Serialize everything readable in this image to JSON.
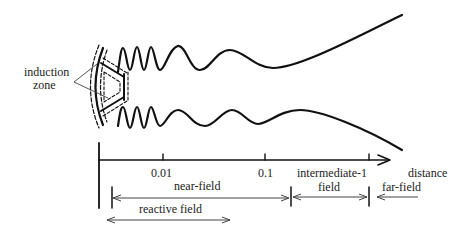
{
  "diagram": {
    "type": "antenna field regions",
    "labels": {
      "induction_zone_line1": "induction",
      "induction_zone_line2": "zone",
      "tick_1": "0.01",
      "tick_2": "0.1",
      "intermediate_line1": "intermediate-1",
      "intermediate_line2": "field",
      "axis_label": "distance",
      "near_field": "near-field",
      "far_field": "far-field",
      "reactive_field": "reactive field"
    },
    "colors": {
      "ink": "#111111",
      "arrow": "#444444",
      "background": "#ffffff"
    }
  }
}
